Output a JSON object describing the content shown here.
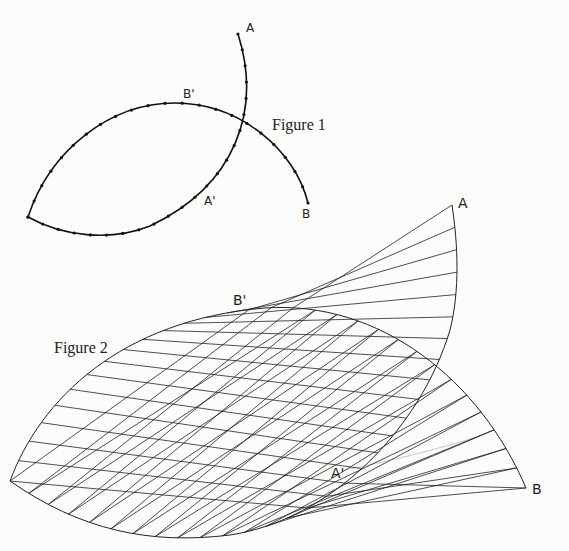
{
  "figure1": {
    "caption": "Figure 1",
    "labels": {
      "A": "A",
      "B": "B",
      "A_prime": "A'",
      "B_prime": "B'"
    },
    "divisions_per_arc": 22
  },
  "figure2": {
    "caption": "Figure 2",
    "labels": {
      "A": "A",
      "B": "B",
      "A_prime": "A'",
      "B_prime": "B'"
    },
    "chord_count": 30
  }
}
